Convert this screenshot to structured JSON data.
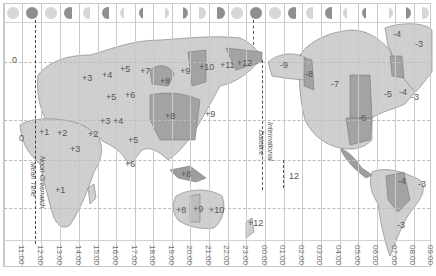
{
  "map": {
    "type": "world-time-zone-map",
    "greenwich_label": [
      "Noon Greenwich",
      "Mean Time"
    ],
    "dateline_label": [
      "International",
      "Dateline"
    ],
    "time_ticks": [
      "11:00",
      "12:00",
      "13:00",
      "14:00",
      "15:00",
      "16:00",
      "17:00",
      "18:00",
      "19:00",
      "20:00",
      "21:00",
      "22:00",
      "23:00",
      "00:00",
      "01:00",
      "02:00",
      "03:00",
      "04:00",
      "05:00",
      "06:00",
      "07:00",
      "08:00",
      "09:00"
    ],
    "moon_phases": [
      "waning-gibbous-light",
      "full-dark",
      "waning-gibbous-light",
      "waning-gibbous",
      "last-quarter-light",
      "last-quarter",
      "waning-crescent-light",
      "waning-crescent",
      "waxing-crescent-light",
      "waxing-crescent",
      "first-quarter-light",
      "first-quarter",
      "waxing-gibbous-light",
      "waxing-gibbous",
      "full-dark",
      "waning-gibbous-light",
      "waning-gibbous",
      "last-quarter-light",
      "last-quarter",
      "waning-crescent-light",
      "waning-crescent",
      "waxing-crescent-light",
      "waxing-crescent"
    ],
    "zone_labels": [
      {
        "text": "0",
        "x": 12,
        "y": 61
      },
      {
        "text": "+3",
        "x": 82,
        "y": 79
      },
      {
        "text": "+4",
        "x": 102,
        "y": 76
      },
      {
        "text": "+5",
        "x": 120,
        "y": 70
      },
      {
        "text": "+5",
        "x": 106,
        "y": 98
      },
      {
        "text": "+6",
        "x": 125,
        "y": 96
      },
      {
        "text": "+7",
        "x": 140,
        "y": 72
      },
      {
        "text": "+8",
        "x": 160,
        "y": 82
      },
      {
        "text": "+9",
        "x": 180,
        "y": 72
      },
      {
        "text": "+10",
        "x": 199,
        "y": 68
      },
      {
        "text": "+11",
        "x": 220,
        "y": 66
      },
      {
        "text": "+12",
        "x": 237,
        "y": 64
      },
      {
        "text": "-9",
        "x": 280,
        "y": 66
      },
      {
        "text": "-8",
        "x": 305,
        "y": 75
      },
      {
        "text": "-7",
        "x": 331,
        "y": 85
      },
      {
        "text": "-6",
        "x": 358,
        "y": 119
      },
      {
        "text": "-5",
        "x": 384,
        "y": 95
      },
      {
        "text": "-4",
        "x": 399,
        "y": 93
      },
      {
        "text": "-3",
        "x": 411,
        "y": 98
      },
      {
        "text": "-4",
        "x": 393,
        "y": 35
      },
      {
        "text": "-3",
        "x": 415,
        "y": 45
      },
      {
        "text": "0",
        "x": 19,
        "y": 139
      },
      {
        "text": "+1",
        "x": 39,
        "y": 133
      },
      {
        "text": "+2",
        "x": 57,
        "y": 134
      },
      {
        "text": "+2",
        "x": 88,
        "y": 135
      },
      {
        "text": "+3",
        "x": 70,
        "y": 150
      },
      {
        "text": "+3",
        "x": 100,
        "y": 122
      },
      {
        "text": "+4",
        "x": 113,
        "y": 122
      },
      {
        "text": "+5",
        "x": 128,
        "y": 141
      },
      {
        "text": "+6",
        "x": 125,
        "y": 165
      },
      {
        "text": "+8",
        "x": 165,
        "y": 117
      },
      {
        "text": "+8",
        "x": 181,
        "y": 175
      },
      {
        "text": "+1",
        "x": 55,
        "y": 191
      },
      {
        "text": "+8",
        "x": 176,
        "y": 211
      },
      {
        "text": "+9",
        "x": 193,
        "y": 210
      },
      {
        "text": "+10",
        "x": 209,
        "y": 211
      },
      {
        "text": "+12",
        "x": 248,
        "y": 224
      },
      {
        "text": "+9",
        "x": 205,
        "y": 115
      },
      {
        "text": "12",
        "x": 289,
        "y": 177
      },
      {
        "text": "-4",
        "x": 398,
        "y": 182
      },
      {
        "text": "-3",
        "x": 418,
        "y": 185
      },
      {
        "text": "-3",
        "x": 397,
        "y": 226
      }
    ]
  }
}
